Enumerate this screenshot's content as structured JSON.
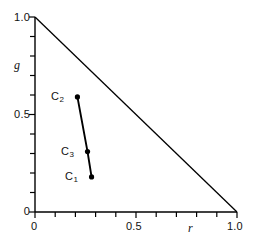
{
  "chart_data": {
    "type": "scatter",
    "title": "",
    "subtitle": "",
    "xlabel": "r",
    "ylabel": "g",
    "xlim": [
      0.0,
      1.0
    ],
    "ylim": [
      0.0,
      1.0
    ],
    "grid": false,
    "legend": null,
    "x_ticks_major": [
      "0",
      "0.5",
      "1.0"
    ],
    "x_ticks_major_values": [
      0.0,
      0.5,
      1.0
    ],
    "y_ticks_major": [
      "0",
      "0.5",
      "1.0"
    ],
    "y_ticks_major_values": [
      0.0,
      0.5,
      1.0
    ],
    "minor_tick_interval": 0.1,
    "boundary": {
      "name": "r + g = 1 chromaticity triangle hypotenuse",
      "from": [
        0.0,
        1.0
      ],
      "to": [
        1.0,
        0.0
      ]
    },
    "series": [
      {
        "name": "chromaticity locus",
        "marker": "filled-circle",
        "line": "solid",
        "points": [
          {
            "label": "C2",
            "label_text": "C",
            "label_sub": "2",
            "r": 0.21,
            "g": 0.59
          },
          {
            "label": "C3",
            "label_text": "C",
            "label_sub": "3",
            "r": 0.26,
            "g": 0.31
          },
          {
            "label": "C1",
            "label_text": "C",
            "label_sub": "1",
            "r": 0.28,
            "g": 0.18
          }
        ]
      }
    ],
    "annotations": [
      {
        "name": "label-c2",
        "text": "C",
        "sub": "2",
        "anchor_r": 0.21,
        "anchor_g": 0.59,
        "placement": "left"
      },
      {
        "name": "label-c3",
        "text": "C",
        "sub": "3",
        "anchor_r": 0.26,
        "anchor_g": 0.31,
        "placement": "left"
      },
      {
        "name": "label-c1",
        "text": "C",
        "sub": "1",
        "anchor_r": 0.28,
        "anchor_g": 0.18,
        "placement": "left"
      }
    ]
  },
  "axes": {
    "x": {
      "title": "r",
      "tick_0": "0",
      "tick_half": "0.5",
      "tick_one": "1.0"
    },
    "y": {
      "title": "g",
      "tick_0": "0",
      "tick_half": "0.5",
      "tick_one": "1.0"
    }
  },
  "labels": {
    "c1_main": "C",
    "c1_sub": "1",
    "c2_main": "C",
    "c2_sub": "2",
    "c3_main": "C",
    "c3_sub": "3"
  },
  "colors": {
    "line": "#000000",
    "marker": "#000000",
    "axis": "#000000",
    "background": "#ffffff",
    "text": "#111111"
  }
}
